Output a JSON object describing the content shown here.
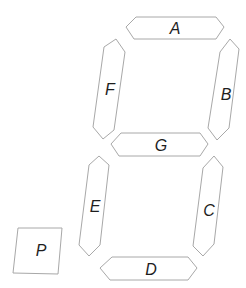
{
  "diagram": {
    "title": "",
    "type": "seven-segment-display",
    "stroke_color": "#a8a8a8",
    "label_color": "#1e1e1e",
    "segments": [
      {
        "id": "A",
        "label": "A",
        "points": "126,27 136,17 216,17 224,27 216,39 134,39",
        "label_x": 175,
        "label_y": 28
      },
      {
        "id": "B",
        "label": "B",
        "points": "230,39 239,49 229,128 217,140 208,128 220,52",
        "label_x": 226,
        "label_y": 94
      },
      {
        "id": "C",
        "label": "C",
        "points": "214,156 223,167 214,244 203,256 193,246 203,168",
        "label_x": 209,
        "label_y": 210
      },
      {
        "id": "D",
        "label": "D",
        "points": "100,268 112,257 188,257 197,268 188,280 110,280",
        "label_x": 151,
        "label_y": 269
      },
      {
        "id": "E",
        "label": "E",
        "points": "99,156 109,165 100,245 89,256 79,245 89,165",
        "label_x": 95,
        "label_y": 206
      },
      {
        "id": "F",
        "label": "F",
        "points": "116,39 125,52 114,130 103,139 93,127 104,47",
        "label_x": 110,
        "label_y": 89
      },
      {
        "id": "G",
        "label": "G",
        "points": "111,144 121,133 200,133 208,144 200,156 119,156",
        "label_x": 161,
        "label_y": 145
      },
      {
        "id": "P",
        "label": "P",
        "points": "18,228 62,228 58,274 13,273",
        "label_x": 41,
        "label_y": 250
      }
    ]
  }
}
